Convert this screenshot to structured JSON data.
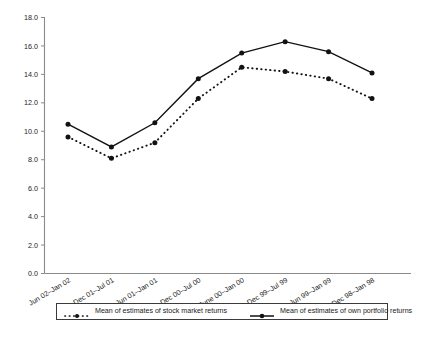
{
  "chart_data": {
    "type": "line",
    "title": "",
    "xlabel": "",
    "ylabel": "",
    "ylim": [
      0.0,
      18.0
    ],
    "yticks": [
      "0.0",
      "2.0",
      "4.0",
      "6.0",
      "8.0",
      "10.0",
      "12.0",
      "14.0",
      "16.0",
      "18.0"
    ],
    "grid": false,
    "legend_position": "bottom",
    "categories": [
      "Jun 02–Jan 02",
      "Dec 01–Jul 01",
      "Jun 01–Jan 01",
      "Dec 00–Jul 00",
      "June 00–Jan 00",
      "Dec 99–Jul 99",
      "Jun 99–Jan 99",
      "Dec 98–Jan 98"
    ],
    "series": [
      {
        "name": "Mean of estimates of stock market returns",
        "style": "dotted",
        "color": "#121212",
        "values": [
          9.6,
          8.1,
          9.2,
          12.3,
          14.5,
          14.2,
          13.7,
          12.3
        ]
      },
      {
        "name": "Mean of estimates of own portfolio returns",
        "style": "solid",
        "color": "#121212",
        "values": [
          10.5,
          8.9,
          10.6,
          13.7,
          15.5,
          16.3,
          15.6,
          14.1
        ]
      }
    ]
  },
  "legend": {
    "entries": [
      {
        "label": "Mean of estimates of stock market returns",
        "style": "dotted"
      },
      {
        "label": "Mean of estimates of own portfolio returns",
        "style": "solid"
      }
    ]
  }
}
